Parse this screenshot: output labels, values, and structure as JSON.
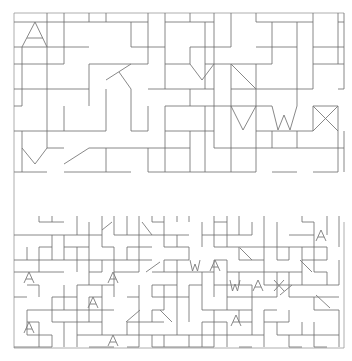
{
  "colors": {
    "background": "#ffffff",
    "line": "#6a6a6a",
    "glyph": "#7a7a7a",
    "frame": "#9a9a9a"
  },
  "upper_panel": {
    "bounds": {
      "x0": 14,
      "y0": 13,
      "x1": 344,
      "y1": 172
    },
    "cols": [
      14,
      22,
      47,
      64,
      89,
      106,
      131,
      148,
      165,
      190,
      205,
      214,
      231,
      256,
      272,
      297,
      313,
      338,
      344
    ],
    "rows": [
      13,
      22,
      47,
      64,
      89,
      106,
      131,
      148,
      172
    ],
    "letters": [
      {
        "char": "A",
        "points": "22,47 35,22 47,47",
        "bar": "27,38 43,38"
      },
      {
        "char": "V",
        "points": "190,64 202,80 214,64"
      },
      {
        "char": "V",
        "points": "231,106 243,130 256,106"
      },
      {
        "char": "W",
        "points": "272,106 278,130 284,115 290,130 297,106"
      },
      {
        "char": "X",
        "points": "313,106 338,131",
        "points2": "313,131 338,106"
      },
      {
        "char": "Y",
        "points": "22,148 35,164 47,148"
      }
    ]
  },
  "lower_panel": {
    "bounds": {
      "x0": 14,
      "y0": 222,
      "x1": 344,
      "y1": 348
    },
    "col_step": 12.5,
    "row_step": 12.5,
    "letters": [
      {
        "char": "A",
        "x": 24,
        "y": 272
      },
      {
        "char": "A",
        "x": 108,
        "y": 272
      },
      {
        "char": "A",
        "x": 88,
        "y": 297
      },
      {
        "char": "A",
        "x": 24,
        "y": 322
      },
      {
        "char": "A",
        "x": 108,
        "y": 335
      },
      {
        "char": "W",
        "x": 190,
        "y": 260
      },
      {
        "char": "A",
        "x": 210,
        "y": 260
      },
      {
        "char": "W",
        "x": 230,
        "y": 280
      },
      {
        "char": "A",
        "x": 253,
        "y": 280
      },
      {
        "char": "X",
        "x": 274,
        "y": 280
      },
      {
        "char": "A",
        "x": 231,
        "y": 315
      },
      {
        "char": "A",
        "x": 316,
        "y": 230
      }
    ]
  },
  "left_divider": {
    "x": 14,
    "y0": 172,
    "y1": 222
  }
}
